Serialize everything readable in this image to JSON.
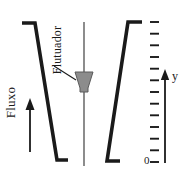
{
  "diagram": {
    "type": "rotameter-schematic",
    "background_color": "#ffffff",
    "stroke_color": "#1a1a1a",
    "float_fill_color": "#8c8c8c",
    "stem_color": "#707070",
    "labels": {
      "flow": "Fluxo",
      "float": "Flutuador",
      "axis_y": "y",
      "axis_zero": "0"
    },
    "scale": {
      "tick_count": 13,
      "tick_top_y": 22,
      "tick_bottom_y": 162,
      "tick_x_start": 150,
      "tick_length": 9
    },
    "tube": {
      "left_wall": {
        "top_x": 35,
        "top_y": 23,
        "bottom_x": 57,
        "bottom_y": 160,
        "cap_x": 22,
        "foot_x": 68
      },
      "right_wall": {
        "top_x": 128,
        "top_y": 22,
        "bottom_x": 107,
        "bottom_y": 161,
        "cap_x": 142,
        "foot_x": 120
      }
    },
    "float_shape": {
      "center_x": 84,
      "top_y": 72,
      "bottom_y": 92,
      "top_half_width": 9,
      "bottom_half_width": 3
    },
    "stem": {
      "x": 84,
      "top_y": 22,
      "bottom_y": 166
    },
    "y_axis": {
      "x": 165,
      "top_y": 70,
      "bottom_y": 163
    }
  }
}
